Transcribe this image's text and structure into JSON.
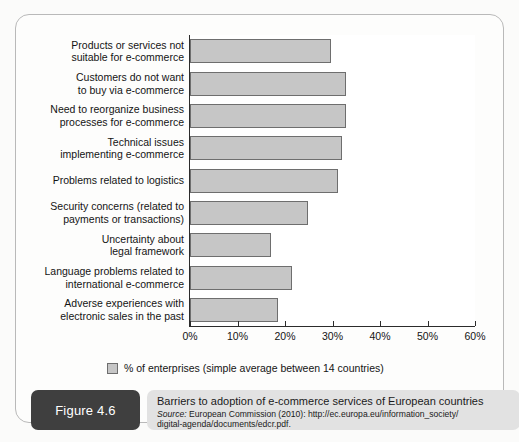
{
  "figure": {
    "tag": "Figure 4.6",
    "caption_title": "Barriers to adoption of e-commerce services of European countries",
    "source_word": "Source:",
    "source_line1": " European Commission (2010): http://ec.europa.eu/information_society/",
    "source_line2": "digital-agenda/documents/edcr.pdf."
  },
  "legend": {
    "label": "% of enterprises (simple average between 14 countries)",
    "swatch_color": "#c6c6c6",
    "swatch_border": "#6e6e6e"
  },
  "chart_data": {
    "type": "bar",
    "orientation": "horizontal",
    "title": "Barriers to adoption of e-commerce services of European countries",
    "xlabel": "",
    "ylabel": "",
    "xlim": [
      0,
      60
    ],
    "grid": false,
    "legend_position": "bottom-left",
    "tick_labels": [
      "0%",
      "10%",
      "20%",
      "30%",
      "40%",
      "50%",
      "60%"
    ],
    "tick_values": [
      0,
      10,
      20,
      30,
      40,
      50,
      60
    ],
    "categories": [
      "Products or services not\nsuitable for e-commerce",
      "Customers do not want\nto buy via e-commerce",
      "Need to reorganize business\nprocesses for e-commerce",
      "Technical issues\nimplementing e-commerce",
      "Problems related to logistics",
      "Security concerns (related to\npayments or transactions)",
      "Uncertainty about\nlegal framework",
      "Language problems related to\ninternational e-commerce",
      "Adverse experiences with\nelectronic sales in the past"
    ],
    "series": [
      {
        "name": "% of enterprises (simple average between 14 countries)",
        "values": [
          29.7,
          32.8,
          32.8,
          32.0,
          31.2,
          24.8,
          17.1,
          21.5,
          18.5
        ]
      }
    ],
    "bar_color": "#c6c6c6",
    "bar_border": "#6e6e6e"
  }
}
